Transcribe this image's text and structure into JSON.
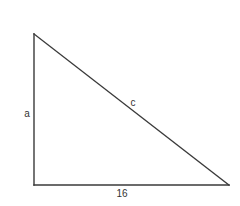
{
  "figure": {
    "type": "right-triangle",
    "vertices": {
      "top_left": [
        34,
        34
      ],
      "bottom_left": [
        34,
        185
      ],
      "bottom_right": [
        229,
        185
      ]
    },
    "labels": {
      "vertical_side": "a",
      "hypotenuse": "c",
      "base": "16"
    },
    "colors": {
      "line": "#3a3a3a",
      "text": "#333333",
      "background": "#ffffff"
    }
  }
}
